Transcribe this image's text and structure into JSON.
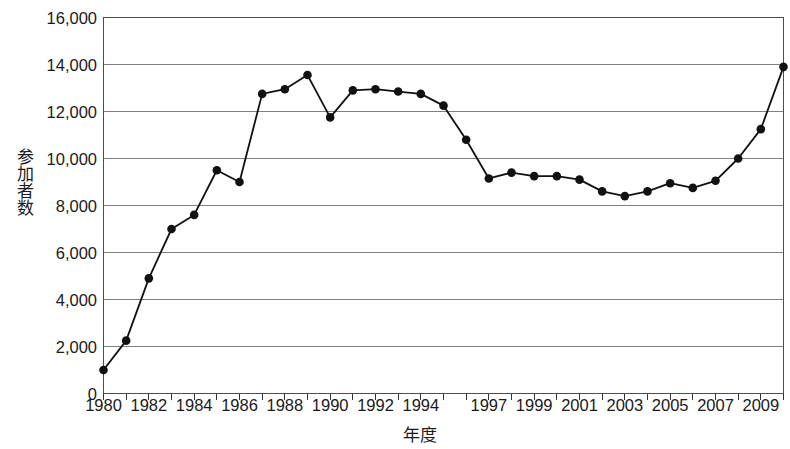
{
  "chart_data": {
    "type": "line",
    "title": "",
    "xlabel": "年度",
    "ylabel": "参加者数",
    "x": [
      1980,
      1981,
      1982,
      1983,
      1984,
      1985,
      1986,
      1987,
      1988,
      1989,
      1990,
      1991,
      1992,
      1993,
      1994,
      1995,
      1996,
      1997,
      1998,
      1999,
      2000,
      2001,
      2002,
      2003,
      2004,
      2005,
      2006,
      2007,
      2008,
      2009,
      2010
    ],
    "values": [
      1000,
      2250,
      4900,
      7000,
      7600,
      9500,
      9000,
      12750,
      12950,
      13550,
      11750,
      12900,
      12950,
      12850,
      12750,
      12250,
      10800,
      9150,
      9400,
      9250,
      9250,
      9100,
      8600,
      8400,
      8600,
      8950,
      8750,
      9050,
      10000,
      11250,
      13900
    ],
    "series": [
      {
        "name": "参加者数",
        "values": [
          1000,
          2250,
          4900,
          7000,
          7600,
          9500,
          9000,
          12750,
          12950,
          13550,
          11750,
          12900,
          12950,
          12850,
          12750,
          12250,
          10800,
          9150,
          9400,
          9250,
          9250,
          9100,
          8600,
          8400,
          8600,
          8950,
          8750,
          9050,
          10000,
          11250,
          13900
        ],
        "color": "#111111",
        "marker": "circle"
      }
    ],
    "xlim": [
      1980,
      2010
    ],
    "ylim": [
      0,
      16000
    ],
    "ytick_labels": [
      "16,000",
      "14,000",
      "12,000",
      "10,000",
      "8,000",
      "6,000",
      "4,000",
      "2,000",
      "0"
    ],
    "ytick_values": [
      16000,
      14000,
      12000,
      10000,
      8000,
      6000,
      4000,
      2000,
      0
    ],
    "xtick_labels": [
      "1980",
      "1982",
      "1984",
      "1986",
      "1988",
      "1990",
      "1992",
      "1994",
      "1997",
      "1999",
      "2001",
      "2003",
      "2005",
      "2007",
      "2009"
    ],
    "xtick_label_values": [
      1980,
      1982,
      1984,
      1986,
      1988,
      1990,
      1992,
      1994,
      1997,
      1999,
      2001,
      2003,
      2005,
      2007,
      2009
    ],
    "xtick_all_values": [
      1980,
      1981,
      1982,
      1983,
      1984,
      1985,
      1986,
      1987,
      1988,
      1989,
      1990,
      1991,
      1992,
      1993,
      1994,
      1995,
      1996,
      1997,
      1998,
      1999,
      2000,
      2001,
      2002,
      2003,
      2004,
      2005,
      2006,
      2007,
      2008,
      2009,
      2010
    ],
    "grid": true,
    "grid_axis": "y",
    "legend": false,
    "legend_position": "none",
    "annotations": []
  },
  "style": {
    "background": "#ffffff",
    "grid_color": "#808080",
    "frame_color": "#4d4d4d",
    "line_color": "#111111",
    "marker_color": "#111111",
    "text_color": "#1a1a1a"
  }
}
